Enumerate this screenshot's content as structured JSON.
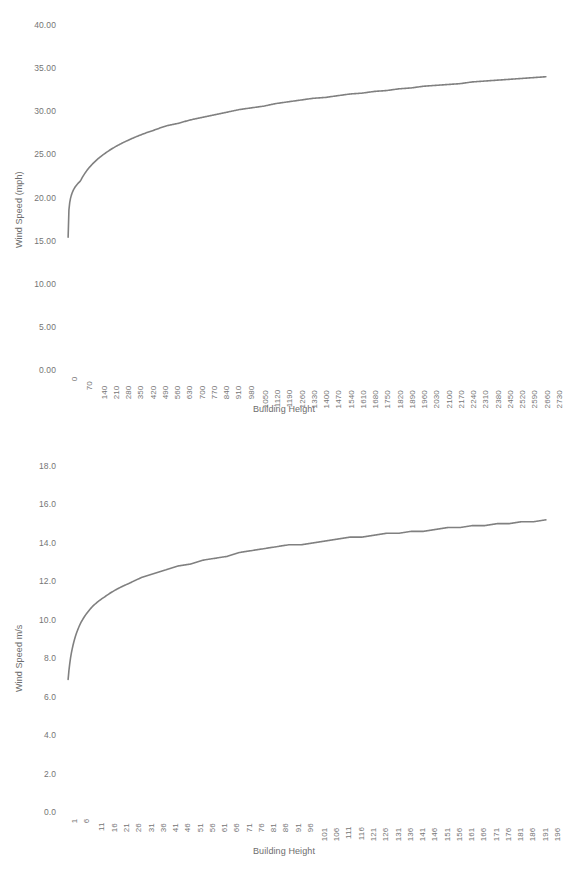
{
  "chart_data": [
    {
      "type": "line",
      "id": "wind-speed-mph",
      "title": "",
      "xlabel": "Building Height",
      "ylabel": "Wind Speed (mph)",
      "ylim": [
        0,
        40
      ],
      "yticks": [
        "0.00",
        "5.00",
        "10.00",
        "15.00",
        "20.00",
        "25.00",
        "30.00",
        "35.00",
        "40.00"
      ],
      "ytick_values": [
        0,
        5,
        10,
        15,
        20,
        25,
        30,
        35,
        40
      ],
      "grid": false,
      "legend": "none",
      "line_color": "#808080",
      "categories": [
        "0",
        "70",
        "140",
        "210",
        "280",
        "350",
        "420",
        "490",
        "560",
        "630",
        "700",
        "770",
        "840",
        "910",
        "980",
        "1050",
        "1120",
        "1190",
        "1260",
        "1330",
        "1400",
        "1470",
        "1540",
        "1610",
        "1680",
        "1750",
        "1820",
        "1890",
        "1960",
        "2030",
        "2100",
        "2170",
        "2240",
        "2310",
        "2380",
        "2450",
        "2520",
        "2590",
        "2660",
        "2730"
      ],
      "x": [
        0,
        70,
        140,
        210,
        280,
        350,
        420,
        490,
        560,
        630,
        700,
        770,
        840,
        910,
        980,
        1050,
        1120,
        1190,
        1260,
        1330,
        1400,
        1470,
        1540,
        1610,
        1680,
        1750,
        1820,
        1890,
        1960,
        2030,
        2100,
        2170,
        2240,
        2310,
        2380,
        2450,
        2520,
        2590,
        2660,
        2730
      ],
      "values": [
        15.4,
        21.9,
        23.9,
        25.1,
        26.0,
        26.7,
        27.3,
        27.8,
        28.3,
        28.6,
        29.0,
        29.3,
        29.6,
        29.9,
        30.2,
        30.4,
        30.6,
        30.9,
        31.1,
        31.3,
        31.5,
        31.6,
        31.8,
        32.0,
        32.1,
        32.3,
        32.4,
        32.6,
        32.7,
        32.9,
        33.0,
        33.1,
        33.2,
        33.4,
        33.5,
        33.6,
        33.7,
        33.8,
        33.9,
        34.0
      ]
    },
    {
      "type": "line",
      "id": "wind-speed-ms",
      "title": "",
      "xlabel": "Building Height",
      "ylabel": "Wind Speed  m/s",
      "ylim": [
        0,
        18
      ],
      "yticks": [
        "0.0",
        "2.0",
        "4.0",
        "6.0",
        "8.0",
        "10.0",
        "12.0",
        "14.0",
        "16.0",
        "18.0"
      ],
      "ytick_values": [
        0,
        2,
        4,
        6,
        8,
        10,
        12,
        14,
        16,
        18
      ],
      "grid": false,
      "legend": "none",
      "line_color": "#808080",
      "categories": [
        "1",
        "6",
        "11",
        "16",
        "21",
        "26",
        "31",
        "36",
        "41",
        "46",
        "51",
        "56",
        "61",
        "66",
        "71",
        "76",
        "81",
        "86",
        "91",
        "96",
        "101",
        "106",
        "111",
        "116",
        "121",
        "126",
        "131",
        "136",
        "141",
        "146",
        "151",
        "156",
        "161",
        "166",
        "171",
        "176",
        "181",
        "186",
        "191",
        "196"
      ],
      "x": [
        1,
        6,
        11,
        16,
        21,
        26,
        31,
        36,
        41,
        46,
        51,
        56,
        61,
        66,
        71,
        76,
        81,
        86,
        91,
        96,
        101,
        106,
        111,
        116,
        121,
        126,
        131,
        136,
        141,
        146,
        151,
        156,
        161,
        166,
        171,
        176,
        181,
        186,
        191,
        196
      ],
      "values": [
        6.9,
        9.8,
        10.7,
        11.2,
        11.6,
        11.9,
        12.2,
        12.4,
        12.6,
        12.8,
        12.9,
        13.1,
        13.2,
        13.3,
        13.5,
        13.6,
        13.7,
        13.8,
        13.9,
        13.9,
        14.0,
        14.1,
        14.2,
        14.3,
        14.3,
        14.4,
        14.5,
        14.5,
        14.6,
        14.6,
        14.7,
        14.8,
        14.8,
        14.9,
        14.9,
        15.0,
        15.0,
        15.1,
        15.1,
        15.2
      ]
    }
  ]
}
